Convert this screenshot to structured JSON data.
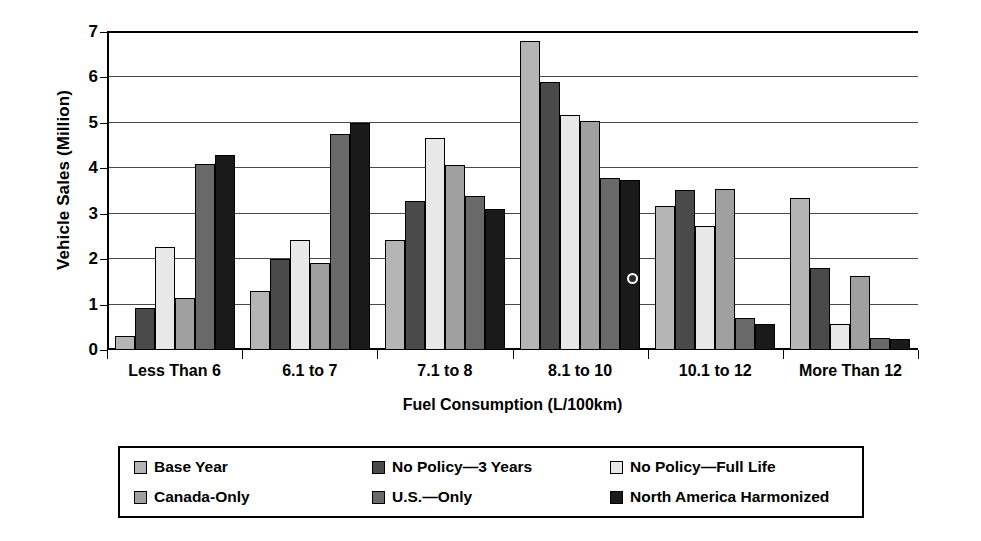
{
  "chart_data": {
    "type": "bar",
    "title": "",
    "xlabel": "Fuel Consumption (L/100km)",
    "ylabel": "Vehicle Sales (Million)",
    "ylim": [
      0,
      7
    ],
    "yticks": [
      0,
      1,
      2,
      3,
      4,
      5,
      6,
      7
    ],
    "ytick_labels": [
      "0",
      "1",
      "2",
      "3",
      "4",
      "5",
      "6",
      "7"
    ],
    "grid": true,
    "legend_position": "bottom",
    "categories": [
      "Less Than 6",
      "6.1 to 7",
      "7.1 to 8",
      "8.1 to 10",
      "10.1 to 12",
      "More Than 12"
    ],
    "series": [
      {
        "name": "Base Year",
        "color": "#b5b5b5",
        "values": [
          0.3,
          1.3,
          2.42,
          6.8,
          3.18,
          3.35
        ]
      },
      {
        "name": "No Policy—3 Years",
        "color": "#4a4a4a",
        "values": [
          0.92,
          2.0,
          3.28,
          5.9,
          3.52,
          1.8
        ]
      },
      {
        "name": "No Policy—Full Life",
        "color": "#e8e8e8",
        "values": [
          2.26,
          2.42,
          4.66,
          5.18,
          2.72,
          0.57
        ]
      },
      {
        "name": "Canada-Only",
        "color": "#a0a0a0",
        "values": [
          1.14,
          1.92,
          4.08,
          5.05,
          3.55,
          1.62
        ]
      },
      {
        "name": "U.S.—Only",
        "color": "#696969",
        "values": [
          4.1,
          4.75,
          3.38,
          3.78,
          0.7,
          0.27
        ]
      },
      {
        "name": "North America Harmonized",
        "color": "#1a1a1a",
        "values": [
          4.3,
          5.0,
          3.1,
          3.75,
          0.58,
          0.24
        ]
      }
    ],
    "annotations": [
      {
        "name": "scan-artifact-dot",
        "series": "North America Harmonized",
        "category": "8.1 to 10"
      }
    ]
  },
  "legend": {
    "items": [
      {
        "label": "Base Year",
        "color": "#b5b5b5"
      },
      {
        "label": "No Policy—3 Years",
        "color": "#4a4a4a"
      },
      {
        "label": "No Policy—Full Life",
        "color": "#e8e8e8"
      },
      {
        "label": "Canada-Only",
        "color": "#a0a0a0"
      },
      {
        "label": "U.S.—Only",
        "color": "#696969"
      },
      {
        "label": "North America Harmonized",
        "color": "#1a1a1a"
      }
    ]
  }
}
